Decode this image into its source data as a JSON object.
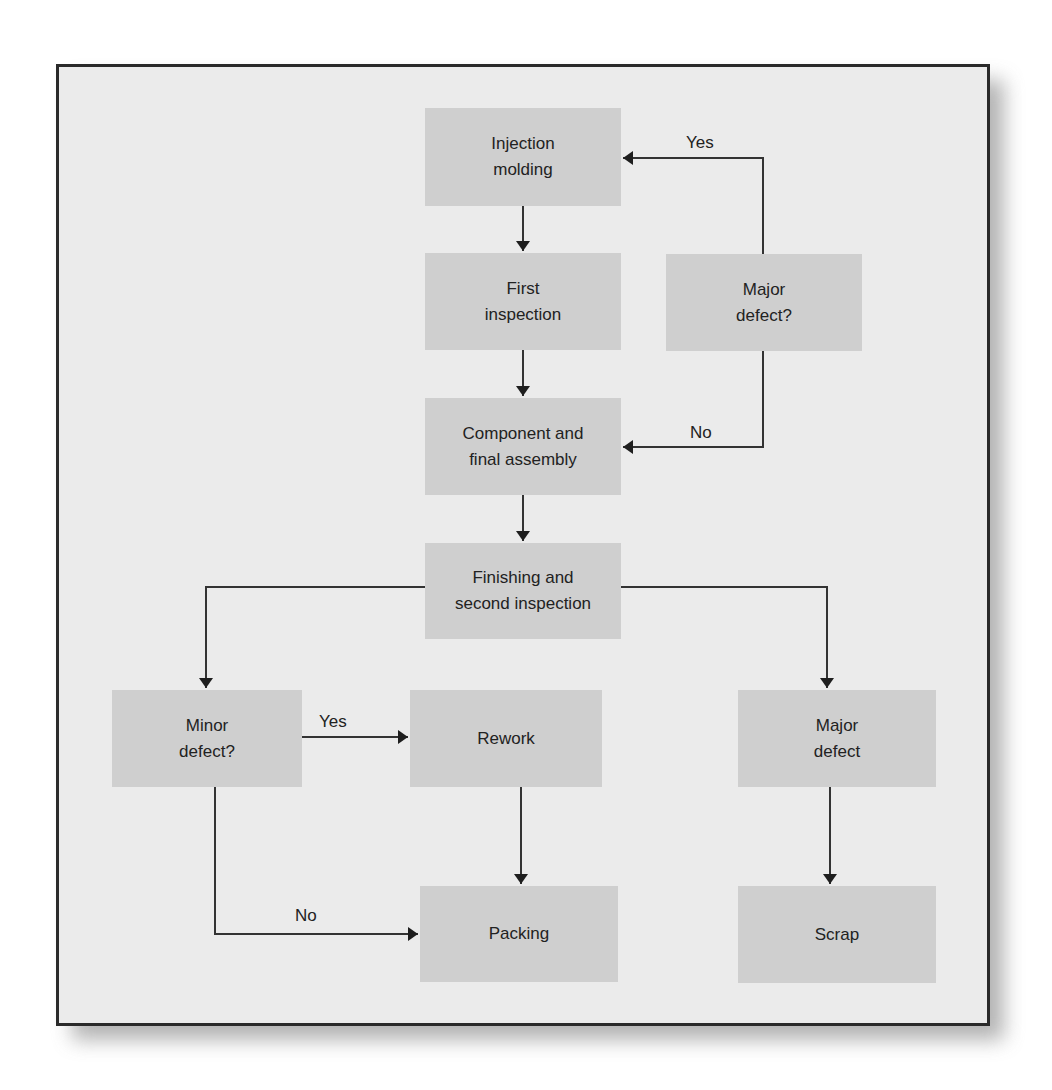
{
  "diagram": {
    "type": "flowchart",
    "colors": {
      "panel_background": "#ebebeb",
      "box_fill": "#cfcfcf",
      "border": "#2a2a2a",
      "line": "#333333",
      "text": "#222222"
    },
    "nodes": {
      "injection_molding": {
        "label": "Injection\nmolding"
      },
      "first_inspection": {
        "label": "First\ninspection"
      },
      "major_defect_question": {
        "label": "Major\ndefect?"
      },
      "component_assembly": {
        "label": "Component and\nfinal assembly"
      },
      "finishing_inspection": {
        "label": "Finishing and\nsecond inspection"
      },
      "minor_defect_question": {
        "label": "Minor\ndefect?"
      },
      "rework": {
        "label": "Rework"
      },
      "major_defect": {
        "label": "Major\ndefect"
      },
      "packing": {
        "label": "Packing"
      },
      "scrap": {
        "label": "Scrap"
      }
    },
    "edge_labels": {
      "major_yes": "Yes",
      "major_no": "No",
      "minor_yes": "Yes",
      "minor_no": "No"
    },
    "edges": [
      {
        "from": "injection_molding",
        "to": "first_inspection",
        "label": ""
      },
      {
        "from": "first_inspection",
        "to": "component_assembly",
        "label": ""
      },
      {
        "from": "major_defect_question",
        "to": "injection_molding",
        "label": "Yes"
      },
      {
        "from": "major_defect_question",
        "to": "component_assembly",
        "label": "No"
      },
      {
        "from": "component_assembly",
        "to": "finishing_inspection",
        "label": ""
      },
      {
        "from": "finishing_inspection",
        "to": "minor_defect_question",
        "label": ""
      },
      {
        "from": "finishing_inspection",
        "to": "major_defect",
        "label": ""
      },
      {
        "from": "minor_defect_question",
        "to": "rework",
        "label": "Yes"
      },
      {
        "from": "minor_defect_question",
        "to": "packing",
        "label": "No"
      },
      {
        "from": "rework",
        "to": "packing",
        "label": ""
      },
      {
        "from": "major_defect",
        "to": "scrap",
        "label": ""
      }
    ]
  }
}
